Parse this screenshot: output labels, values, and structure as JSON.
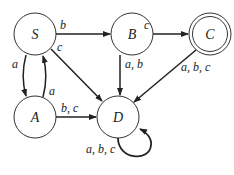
{
  "diagram": {
    "type": "finite-automaton",
    "states": [
      {
        "id": "S",
        "label": "S",
        "accepting": false
      },
      {
        "id": "B",
        "label": "B",
        "accepting": false
      },
      {
        "id": "C",
        "label": "C",
        "accepting": true
      },
      {
        "id": "A",
        "label": "A",
        "accepting": false
      },
      {
        "id": "D",
        "label": "D",
        "accepting": false
      }
    ],
    "transitions": [
      {
        "from": "S",
        "to": "B",
        "label": "b"
      },
      {
        "from": "S",
        "to": "D",
        "label": "c"
      },
      {
        "from": "S",
        "to": "A",
        "label": "a"
      },
      {
        "from": "A",
        "to": "S",
        "label": "a"
      },
      {
        "from": "B",
        "to": "C",
        "label": "c"
      },
      {
        "from": "B",
        "to": "D",
        "label": "a, b"
      },
      {
        "from": "C",
        "to": "D",
        "label": "a, b, c"
      },
      {
        "from": "A",
        "to": "D",
        "label": "b, c"
      },
      {
        "from": "D",
        "to": "D",
        "label": "a, b, c"
      }
    ]
  }
}
